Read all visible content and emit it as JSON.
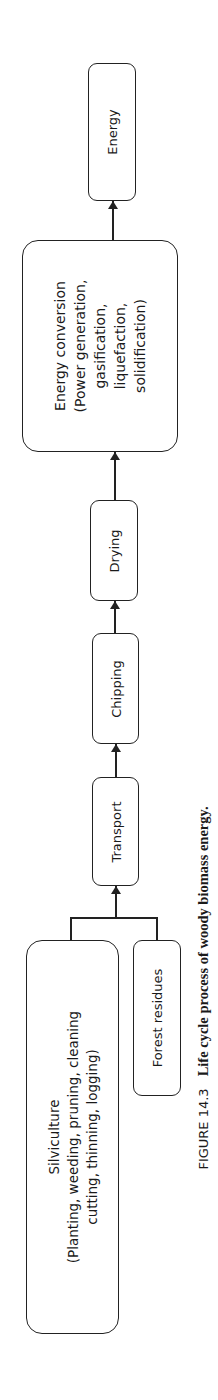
{
  "diagram": {
    "nodes": {
      "energy": {
        "label": "Energy"
      },
      "energy_conversion": {
        "lines": [
          "Energy conversion",
          "(Power generation,",
          "gasification,",
          "liquefaction,",
          "solidification)"
        ]
      },
      "drying": {
        "label": "Drying"
      },
      "chipping": {
        "label": "Chipping"
      },
      "transport": {
        "label": "Transport"
      },
      "silviculture": {
        "lines": [
          "Silviculture",
          "(Planting, weeding, pruning, cleaning",
          "cutting, thinning, logging)"
        ]
      },
      "forest_residues": {
        "label": "Forest residues"
      }
    },
    "edges": [
      [
        "silviculture",
        "transport"
      ],
      [
        "forest_residues",
        "transport"
      ],
      [
        "transport",
        "chipping"
      ],
      [
        "chipping",
        "drying"
      ],
      [
        "drying",
        "energy_conversion"
      ],
      [
        "energy_conversion",
        "energy"
      ]
    ]
  },
  "caption": {
    "number": "FIGURE 14.3",
    "text": "Life cycle process of woody biomass energy."
  }
}
